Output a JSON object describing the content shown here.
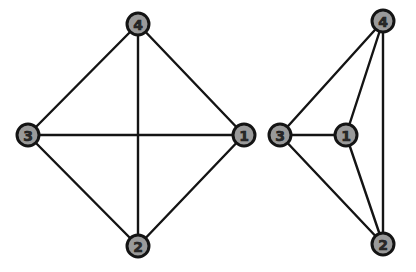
{
  "diagram": {
    "background": "#ffffff",
    "node_fill": "#9a9a9a",
    "node_stroke": "#141414",
    "edge_color": "#141414",
    "node_radius": 11,
    "graphs": [
      {
        "name": "k4-square-embedding",
        "nodes": [
          {
            "id": "1",
            "label": "1",
            "x": 244,
            "y": 135
          },
          {
            "id": "2",
            "label": "2",
            "x": 138,
            "y": 246
          },
          {
            "id": "3",
            "label": "3",
            "x": 28,
            "y": 135
          },
          {
            "id": "4",
            "label": "4",
            "x": 138,
            "y": 24
          }
        ],
        "edges": [
          [
            "4",
            "3"
          ],
          [
            "4",
            "1"
          ],
          [
            "4",
            "2"
          ],
          [
            "3",
            "1"
          ],
          [
            "3",
            "2"
          ],
          [
            "1",
            "2"
          ]
        ]
      },
      {
        "name": "k4-planar-embedding",
        "nodes": [
          {
            "id": "1",
            "label": "1",
            "x": 346,
            "y": 135
          },
          {
            "id": "2",
            "label": "2",
            "x": 383,
            "y": 244
          },
          {
            "id": "3",
            "label": "3",
            "x": 280,
            "y": 135
          },
          {
            "id": "4",
            "label": "4",
            "x": 383,
            "y": 21
          }
        ],
        "edges": [
          [
            "4",
            "3"
          ],
          [
            "4",
            "1"
          ],
          [
            "4",
            "2"
          ],
          [
            "3",
            "1"
          ],
          [
            "3",
            "2"
          ],
          [
            "1",
            "2"
          ]
        ]
      }
    ]
  }
}
